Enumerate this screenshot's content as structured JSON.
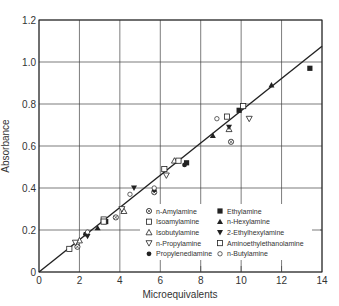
{
  "chart_data": {
    "type": "scatter",
    "title": "",
    "xlabel": "Microequivalents",
    "ylabel": "Absorbance",
    "xlim": [
      0,
      14
    ],
    "ylim": [
      0,
      1.2
    ],
    "xticks": [
      "0",
      "2",
      "4",
      "6",
      "8",
      "10",
      "12",
      "14"
    ],
    "yticks": [
      "0",
      "0.2",
      "0.4",
      "0.6",
      "0.8",
      "1.0",
      "1.2"
    ],
    "grid": true,
    "legend_position": "lower right (inside)",
    "fit_line": {
      "x": [
        0,
        14
      ],
      "y": [
        0,
        1.075
      ]
    },
    "series": [
      {
        "name": "n-Amylamine",
        "marker": "circle-cross",
        "points": [
          [
            1.9,
            0.12
          ],
          [
            3.8,
            0.26
          ],
          [
            5.7,
            0.38
          ],
          [
            9.5,
            0.62
          ]
        ]
      },
      {
        "name": "Isoamylamine",
        "marker": "square-open",
        "points": [
          [
            1.5,
            0.11
          ],
          [
            3.2,
            0.25
          ],
          [
            6.2,
            0.49
          ],
          [
            9.3,
            0.74
          ]
        ]
      },
      {
        "name": "Isobutylamine",
        "marker": "triangle-up-open",
        "points": [
          [
            2.0,
            0.15
          ],
          [
            4.2,
            0.29
          ],
          [
            6.7,
            0.53
          ],
          [
            9.4,
            0.68
          ]
        ]
      },
      {
        "name": "n-Propylamine",
        "marker": "triangle-down-open",
        "points": [
          [
            1.8,
            0.14
          ],
          [
            4.1,
            0.3
          ],
          [
            6.3,
            0.46
          ],
          [
            10.4,
            0.73
          ]
        ]
      },
      {
        "name": "Propylenediamine",
        "marker": "circle-filled",
        "points": [
          [
            2.3,
            0.18
          ],
          [
            5.7,
            0.39
          ],
          [
            7.2,
            0.51
          ]
        ]
      },
      {
        "name": "Ethylamine",
        "marker": "square-filled",
        "points": [
          [
            3.3,
            0.24
          ],
          [
            7.3,
            0.52
          ],
          [
            9.9,
            0.77
          ],
          [
            13.4,
            0.97
          ]
        ]
      },
      {
        "name": "n-Hexylamine",
        "marker": "triangle-up-filled",
        "points": [
          [
            2.9,
            0.21
          ],
          [
            8.6,
            0.65
          ],
          [
            11.5,
            0.89
          ]
        ]
      },
      {
        "name": "2-Ethylhexylamine",
        "marker": "triangle-down-filled",
        "points": [
          [
            2.4,
            0.17
          ],
          [
            4.7,
            0.4
          ],
          [
            9.4,
            0.69
          ]
        ]
      },
      {
        "name": "Aminoethylethanolamine",
        "marker": "square-open",
        "points": [
          [
            3.2,
            0.24
          ],
          [
            6.9,
            0.53
          ],
          [
            10.1,
            0.79
          ]
        ]
      },
      {
        "name": "n-Butylamine",
        "marker": "circle-open-small",
        "points": [
          [
            2.4,
            0.19
          ],
          [
            4.5,
            0.37
          ],
          [
            5.7,
            0.4
          ],
          [
            8.8,
            0.73
          ]
        ]
      }
    ]
  },
  "legend": {
    "left": [
      "n-Amylamine",
      "Isoamylamine",
      "Isobutylamine",
      "n-Propylamine",
      "Propylenediamine"
    ],
    "right": [
      "Ethylamine",
      "n-Hexylamine",
      "2-Ethylhexylamine",
      "Aminoethylethanolamine",
      "n-Butylamine"
    ]
  },
  "colors": {
    "ink": "#222222",
    "grid": "#444444",
    "background": "#ffffff"
  }
}
